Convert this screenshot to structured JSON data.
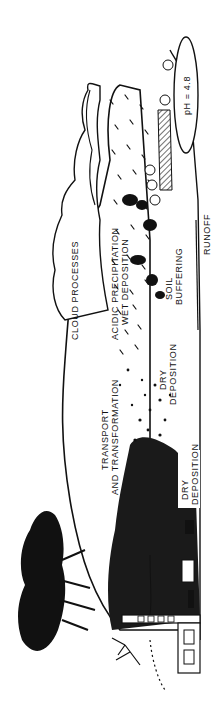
{
  "diagram": {
    "orientation": "rotated-90-clockwise",
    "colors": {
      "ink": "#111111",
      "paper": "#ffffff"
    },
    "labels": {
      "cloud_processes": "CLOUD PROCESSES",
      "acidic_precipitation": "ACIDIC PRECIPITATION",
      "wet_deposition": "WET DEPOSITION",
      "transport": "TRANSPORT",
      "transformation": "AND TRANSFORMATION",
      "dry_deposition_1_line1": "DRY",
      "dry_deposition_1_line2": "DEPOSITION",
      "dry_deposition_2_line1": "DRY",
      "dry_deposition_2_line2": "DEPOSITION",
      "soil": "SOIL",
      "buffering": "BUFFERING",
      "runoff": "RUNOFF",
      "lake_ph": "pH = 4.8"
    },
    "elements": [
      "factory",
      "smoke-plume",
      "tree-silhouette",
      "house",
      "cars",
      "cloud",
      "rain",
      "forest",
      "lake",
      "soil",
      "runoff-stream"
    ]
  }
}
